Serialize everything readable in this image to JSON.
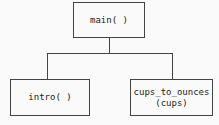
{
  "diagram": {
    "type": "structure-chart",
    "width": 219,
    "height": 125,
    "background_color": "#fafafa",
    "line_color": "#444444",
    "text_color": "#1c1c1c",
    "nodes": [
      {
        "id": "main",
        "label": "main( )",
        "lines": [
          "main( )"
        ],
        "level": 0,
        "x": 73,
        "y": 2,
        "width": 72,
        "height": 36
      },
      {
        "id": "intro",
        "label": "intro( )",
        "lines": [
          "intro( )"
        ],
        "level": 1,
        "x": 10,
        "y": 79,
        "width": 80,
        "height": 37
      },
      {
        "id": "cups_to_ounces",
        "label": "cups_to_ounces (cups)",
        "lines": [
          "cups_to_ounces",
          "(cups)"
        ],
        "level": 1,
        "x": 130,
        "y": 79,
        "width": 83,
        "height": 37
      }
    ],
    "edges": [
      {
        "from": "main",
        "to": "intro"
      },
      {
        "from": "main",
        "to": "cups_to_ounces"
      }
    ]
  }
}
